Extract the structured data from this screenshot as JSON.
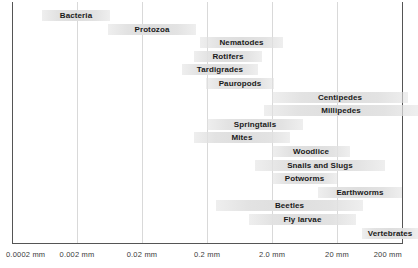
{
  "chart_data": {
    "type": "bar",
    "orientation": "horizontal-range",
    "title": "",
    "subtitle": "",
    "xlabel": "",
    "ylabel": "",
    "xscale": "log",
    "grid": true,
    "legend": null,
    "xticks": [
      "0.0002 mm",
      "0.002  mm",
      "0.02 mm",
      "0.2 mm",
      "2.0 mm",
      "20 mm",
      "200 mm"
    ],
    "xtick_values": [
      0.0002,
      0.002,
      0.02,
      0.2,
      2.0,
      20,
      200
    ],
    "xlim": [
      0.0002,
      200
    ],
    "bar_color": "#e1e1e1",
    "label_color": "#1a1a1a",
    "categories": [
      "Bacteria",
      "Protozoa",
      "Nematodes",
      "Rotifers",
      "Tardigrades",
      "Pauropods",
      "Centipedes",
      "Millipedes",
      "Springtails",
      "Mites",
      "Woodlice",
      "Snails and Slugs",
      "Potworms",
      "Earthworms",
      "Beetles",
      "Fly larvae",
      "Vertebrates"
    ],
    "bars": [
      {
        "label": "Bacteria",
        "x_start_mm": 0.00044,
        "x_end_mm": 0.0135,
        "px_start": 42,
        "px_end": 110,
        "row": 0,
        "align": "center"
      },
      {
        "label": "Protozoa",
        "x_start_mm": 0.0028,
        "x_end_mm": 0.088,
        "px_start": 108,
        "px_end": 196,
        "row": 1,
        "align": "center"
      },
      {
        "label": "Nematodes",
        "x_start_mm": 0.13,
        "x_end_mm": 3.2,
        "px_start": 200,
        "px_end": 283,
        "row": 2,
        "align": "center"
      },
      {
        "label": "Rotifers",
        "x_start_mm": 0.085,
        "x_end_mm": 1.4,
        "px_start": 194,
        "px_end": 262,
        "row": 3,
        "align": "center"
      },
      {
        "label": "Tardigrades",
        "x_start_mm": 0.05,
        "x_end_mm": 1.2,
        "px_start": 182,
        "px_end": 258,
        "row": 4,
        "align": "center"
      },
      {
        "label": "Pauropods",
        "x_start_mm": 0.19,
        "x_end_mm": 3.0,
        "px_start": 206,
        "px_end": 274,
        "row": 5,
        "align": "center"
      },
      {
        "label": "Centipedes",
        "x_start_mm": 2.2,
        "x_end_mm": 260,
        "px_start": 272,
        "px_end": 408,
        "row": 6,
        "align": "center"
      },
      {
        "label": "Millipedes",
        "x_start_mm": 1.5,
        "x_end_mm": 300,
        "px_start": 264,
        "px_end": 418,
        "row": 7,
        "align": "center"
      },
      {
        "label": "Springtails",
        "x_start_mm": 0.2,
        "x_end_mm": 12,
        "px_start": 207,
        "px_end": 303,
        "row": 8,
        "align": "center"
      },
      {
        "label": "Mites",
        "x_start_mm": 0.09,
        "x_end_mm": 5.5,
        "px_start": 194,
        "px_end": 290,
        "row": 9,
        "align": "center"
      },
      {
        "label": "Woodlice",
        "x_start_mm": 2.2,
        "x_end_mm": 35,
        "px_start": 272,
        "px_end": 350,
        "row": 10,
        "align": "center"
      },
      {
        "label": "Snails and Slugs",
        "x_start_mm": 0.9,
        "x_end_mm": 120,
        "px_start": 255,
        "px_end": 385,
        "row": 11,
        "align": "center"
      },
      {
        "label": "Potworms",
        "x_start_mm": 2.2,
        "x_end_mm": 20,
        "px_start": 272,
        "px_end": 337,
        "row": 12,
        "align": "center"
      },
      {
        "label": "Earthworms",
        "x_start_mm": 8,
        "x_end_mm": 200,
        "px_start": 318,
        "px_end": 402,
        "row": 13,
        "align": "center"
      },
      {
        "label": "Beetles",
        "x_start_mm": 0.35,
        "x_end_mm": 60,
        "px_start": 216,
        "px_end": 363,
        "row": 14,
        "align": "center"
      },
      {
        "label": "Fly larvae",
        "x_start_mm": 1.0,
        "x_end_mm": 48,
        "px_start": 249,
        "px_end": 356,
        "row": 15,
        "align": "center"
      },
      {
        "label": "Vertebrates",
        "x_start_mm": 55,
        "x_end_mm": 400,
        "px_start": 362,
        "px_end": 418,
        "row": 16,
        "align": "center"
      }
    ]
  }
}
